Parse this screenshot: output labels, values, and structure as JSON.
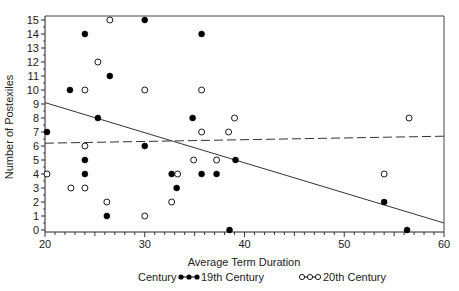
{
  "chart_data": {
    "type": "scatter",
    "title": "",
    "xlabel": "Average Term Duration",
    "ylabel": "Number of Postexiles",
    "xlim": [
      20,
      60
    ],
    "ylim": [
      0,
      15
    ],
    "x_ticks": [
      20,
      30,
      40,
      50,
      60
    ],
    "y_ticks": [
      0,
      1,
      2,
      3,
      4,
      5,
      6,
      7,
      8,
      9,
      10,
      11,
      12,
      13,
      14,
      15
    ],
    "grid": false,
    "legend": {
      "title": "Century",
      "position": "bottom",
      "entries": [
        "19th Century",
        "20th Century"
      ]
    },
    "series": [
      {
        "name": "19th Century",
        "marker": "filled-circle",
        "color": "#000000",
        "points": [
          [
            20.2,
            7
          ],
          [
            22.5,
            10
          ],
          [
            24,
            14
          ],
          [
            24,
            5
          ],
          [
            24,
            4
          ],
          [
            25.3,
            8
          ],
          [
            26.5,
            11
          ],
          [
            26.2,
            1
          ],
          [
            30,
            15
          ],
          [
            30,
            6
          ],
          [
            32.7,
            4
          ],
          [
            33.2,
            3
          ],
          [
            34.8,
            8
          ],
          [
            35.7,
            14
          ],
          [
            35.7,
            4
          ],
          [
            37.2,
            4
          ],
          [
            38.5,
            0
          ],
          [
            39.1,
            5
          ],
          [
            54,
            2
          ],
          [
            56.3,
            0
          ]
        ],
        "trend": {
          "style": "solid",
          "x": [
            20,
            60
          ],
          "y": [
            9.1,
            0.5
          ]
        }
      },
      {
        "name": "20th Century",
        "marker": "open-circle",
        "color": "#000000",
        "points": [
          [
            20.2,
            4
          ],
          [
            22.6,
            3
          ],
          [
            24,
            10
          ],
          [
            24,
            6
          ],
          [
            24,
            3
          ],
          [
            25.3,
            12
          ],
          [
            26.5,
            15
          ],
          [
            26.2,
            2
          ],
          [
            30,
            10
          ],
          [
            30,
            1
          ],
          [
            32.7,
            2
          ],
          [
            33.3,
            4
          ],
          [
            34.9,
            5
          ],
          [
            35.7,
            10
          ],
          [
            35.7,
            7
          ],
          [
            37.2,
            5
          ],
          [
            38.4,
            7
          ],
          [
            39,
            8
          ],
          [
            54,
            4
          ],
          [
            56.5,
            8
          ]
        ],
        "trend": {
          "style": "dashed",
          "x": [
            20,
            60
          ],
          "y": [
            6.2,
            6.7
          ]
        }
      }
    ]
  },
  "axis": {
    "x_label": "Average Term Duration",
    "y_label": "Number of Postexiles"
  },
  "legend": {
    "title": "Century",
    "items": [
      {
        "label": "19th Century"
      },
      {
        "label": "20th Century"
      }
    ]
  }
}
